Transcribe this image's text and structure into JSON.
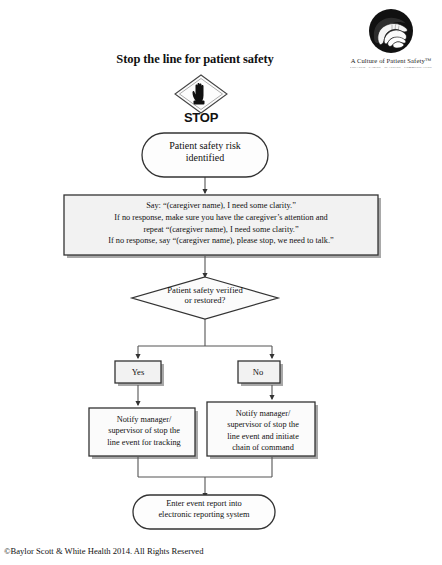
{
  "header": {
    "title": "Stop the line for patient safety",
    "logo": {
      "icon": "hands-cupping-icon",
      "title": "A Culture of Patient Safety™",
      "subtitle": "ENGAGED · CARING · PLANNING · COMMUNICATING"
    },
    "stop_sign": {
      "icon": "stop-hand-icon",
      "label": "STOP"
    }
  },
  "flow": {
    "nodes": [
      {
        "id": "start",
        "shape": "rounded",
        "text": "Patient safety risk identified",
        "lines": [
          "Patient safety risk",
          "identified"
        ]
      },
      {
        "id": "script",
        "shape": "rectangle",
        "lines": [
          "Say: “(caregiver name), I need some clarity.”",
          "If no response, make sure you have the caregiver’s attention and",
          "repeat “(caregiver name), I need some clarity.”",
          "If no response, say “(caregiver name), please stop, we need to talk.”"
        ]
      },
      {
        "id": "decision",
        "shape": "diamond",
        "lines": [
          "Patient safety verified",
          "or restored?"
        ]
      },
      {
        "id": "branch-yes",
        "shape": "rectangle",
        "text": "Yes"
      },
      {
        "id": "branch-no",
        "shape": "rectangle",
        "text": "No"
      },
      {
        "id": "action-left",
        "shape": "rectangle",
        "lines": [
          "Notify manager/",
          "supervisor of stop the",
          "line event for tracking"
        ]
      },
      {
        "id": "action-right",
        "shape": "rectangle",
        "lines": [
          "Notify manager/",
          "supervisor of stop the",
          "line event and initiate",
          "chain of command"
        ]
      },
      {
        "id": "end",
        "shape": "rounded",
        "lines": [
          "Enter event report into",
          "electronic reporting system"
        ]
      }
    ]
  },
  "footer": {
    "copyright": "©Baylor Scott & White Health 2014. All Rights Reserved"
  },
  "colors": {
    "stroke": "#333333",
    "box_fill": "#f2f2f2",
    "shadow": "#9a9a9a",
    "text": "#111111"
  }
}
